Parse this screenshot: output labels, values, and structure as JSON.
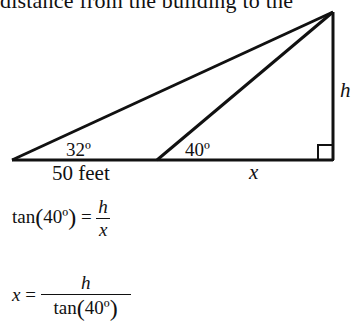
{
  "header_fragment": "distance from the building to the",
  "diagram": {
    "angle_left": "32º",
    "angle_mid": "40º",
    "base_left_label": "50 feet",
    "base_right_label": "x",
    "height_label": "h",
    "right_angle_marker": true
  },
  "equations": {
    "eq1": {
      "lhs_fn": "tan",
      "lhs_arg": "40º",
      "equals": "=",
      "num": "h",
      "den": "x"
    },
    "eq2": {
      "lhs": "x",
      "equals": "=",
      "num": "h",
      "den_fn": "tan",
      "den_arg": "40º"
    }
  }
}
